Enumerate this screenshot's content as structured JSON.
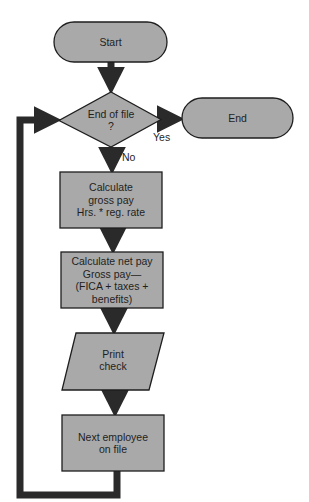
{
  "diagram": {
    "type": "flowchart",
    "colors": {
      "shape_fill": "#a9a9a9",
      "stroke": "#1e1e1e",
      "arrow": "#2a2a2a",
      "background": "#ffffff"
    },
    "nodes": [
      {
        "id": "start",
        "shape": "terminator",
        "label": "Start"
      },
      {
        "id": "eof",
        "shape": "decision",
        "label": "End of file\n?"
      },
      {
        "id": "end",
        "shape": "terminator",
        "label": "End"
      },
      {
        "id": "gross",
        "shape": "process",
        "label": "Calculate\ngross pay\nHrs. * reg. rate"
      },
      {
        "id": "net",
        "shape": "process",
        "label": "Calculate net pay\nGross pay—\n(FICA + taxes +\nbenefits)"
      },
      {
        "id": "print",
        "shape": "io",
        "label": "Print\ncheck"
      },
      {
        "id": "next",
        "shape": "process",
        "label": "Next employee\non file"
      }
    ],
    "edges": [
      {
        "from": "start",
        "to": "eof",
        "label": ""
      },
      {
        "from": "eof",
        "to": "end",
        "label": "Yes"
      },
      {
        "from": "eof",
        "to": "gross",
        "label": "No"
      },
      {
        "from": "gross",
        "to": "net",
        "label": ""
      },
      {
        "from": "net",
        "to": "print",
        "label": ""
      },
      {
        "from": "print",
        "to": "next",
        "label": ""
      },
      {
        "from": "next",
        "to": "eof",
        "label": ""
      }
    ],
    "labels": {
      "start": "Start",
      "eof_line1": "End of file",
      "eof_line2": "?",
      "end": "End",
      "gross_line1": "Calculate",
      "gross_line2": "gross pay",
      "gross_line3": "Hrs. * reg. rate",
      "net_line1": "Calculate net pay",
      "net_line2": "Gross pay—",
      "net_line3": "(FICA + taxes +",
      "net_line4": "benefits)",
      "print_line1": "Print",
      "print_line2": "check",
      "next_line1": "Next employee",
      "next_line2": "on file",
      "yes": "Yes",
      "no": "No"
    }
  }
}
